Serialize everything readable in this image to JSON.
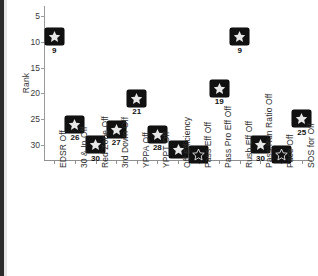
{
  "chart_data": {
    "type": "scatter",
    "title": "",
    "xlabel": "",
    "ylabel": "Rank",
    "ylim": [
      3,
      33
    ],
    "y_inverted": true,
    "yticks": [
      5,
      10,
      15,
      20,
      25,
      30
    ],
    "grid": false,
    "legend": "none",
    "marker_style": "black-rounded-square-with-white-star",
    "categories": [
      "EDSR Off",
      "30 & In Off",
      "Red Zone Off",
      "3rd Down Off",
      "YPPA Off",
      "YPPT Off",
      "Off Efficiency",
      "Pass Eff Off",
      "Pass Pro Eff Off",
      "Rush Eff Off",
      "Pass:Run Ratio Off",
      "Pace Off",
      "SOS for Off"
    ],
    "values": [
      9,
      26,
      30,
      27,
      21,
      28,
      31,
      32,
      19,
      9,
      30,
      32,
      25
    ],
    "point_labels": [
      "9",
      "26",
      "30",
      "27",
      "21",
      "28",
      "",
      "",
      "19",
      "9",
      "30",
      "",
      "25"
    ],
    "points": [
      {
        "category": "EDSR Off",
        "value": 9,
        "label": "9",
        "label_visible": true,
        "marker": "filled"
      },
      {
        "category": "30 & In Off",
        "value": 26,
        "label": "26",
        "label_visible": true,
        "marker": "filled"
      },
      {
        "category": "Red Zone Off",
        "value": 30,
        "label": "30",
        "label_visible": true,
        "marker": "filled"
      },
      {
        "category": "3rd Down Off",
        "value": 27,
        "label": "27",
        "label_visible": true,
        "marker": "filled"
      },
      {
        "category": "YPPA Off",
        "value": 21,
        "label": "21",
        "label_visible": true,
        "marker": "filled"
      },
      {
        "category": "YPPT Off",
        "value": 28,
        "label": "28",
        "label_visible": true,
        "marker": "filled"
      },
      {
        "category": "Off Efficiency",
        "value": 31,
        "label": "",
        "label_visible": false,
        "marker": "filled"
      },
      {
        "category": "Pass Eff Off",
        "value": 32,
        "label": "",
        "label_visible": false,
        "marker": "hollow"
      },
      {
        "category": "Pass Pro Eff Off",
        "value": 19,
        "label": "19",
        "label_visible": true,
        "marker": "filled"
      },
      {
        "category": "Rush Eff Off",
        "value": 9,
        "label": "9",
        "label_visible": true,
        "marker": "filled"
      },
      {
        "category": "Pass:Run Ratio Off",
        "value": 30,
        "label": "30",
        "label_visible": true,
        "marker": "filled"
      },
      {
        "category": "Pace Off",
        "value": 32,
        "label": "",
        "label_visible": false,
        "marker": "hollow"
      },
      {
        "category": "SOS for Off",
        "value": 25,
        "label": "25",
        "label_visible": true,
        "marker": "filled"
      }
    ]
  },
  "axis": {
    "y_title": "Rank",
    "y_tick_labels": [
      "5",
      "10",
      "15",
      "20",
      "25",
      "30"
    ],
    "x_tick_labels": [
      "EDSR Off",
      "30 & In Off",
      "Red Zone Off",
      "3rd Down Off",
      "YPPA Off",
      "YPPT Off",
      "Off Efficiency",
      "Pass Eff Off",
      "Pass Pro Eff Off",
      "Rush Eff Off",
      "Pass:Run Ratio Off",
      "Pace Off",
      "SOS for Off"
    ]
  },
  "colors": {
    "marker_fill": "#111111",
    "star_fill": "#e8e8e8",
    "axis": "#8f8f8f",
    "text": "#2e2e2e",
    "background": "#ffffff"
  }
}
